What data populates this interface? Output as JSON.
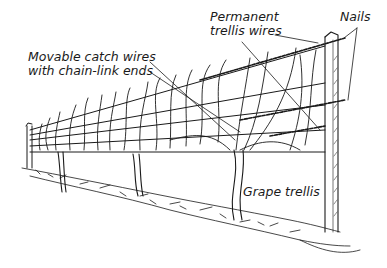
{
  "figure": {
    "title": "Grape trellis",
    "labels": {
      "permanent_wires": [
        "Permanent",
        "trellis wires"
      ],
      "catch_wires": [
        "Movable catch wires",
        "with chain-link ends"
      ],
      "nails": "Nails",
      "grape_trellis": "Grape trellis"
    }
  },
  "colors": {
    "ink": "#1a1a1a",
    "background": "#ffffff"
  }
}
